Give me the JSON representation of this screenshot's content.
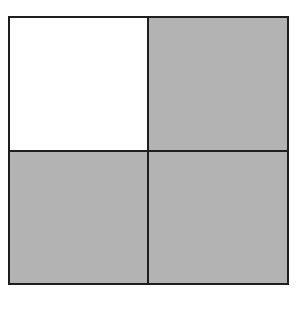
{
  "figure": {
    "rows": 2,
    "cols": 2,
    "border_color": "#1e1e1e",
    "cells": [
      {
        "row": 0,
        "col": 0,
        "shaded": false,
        "fill": "#ffffff"
      },
      {
        "row": 0,
        "col": 1,
        "shaded": true,
        "fill": "#b3b3b3"
      },
      {
        "row": 1,
        "col": 0,
        "shaded": true,
        "fill": "#b3b3b3"
      },
      {
        "row": 1,
        "col": 1,
        "shaded": true,
        "fill": "#b3b3b3"
      }
    ],
    "shaded_count": 3,
    "total_count": 4
  }
}
